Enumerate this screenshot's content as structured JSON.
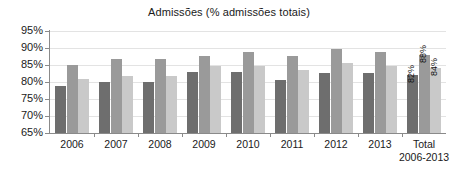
{
  "chart_data": {
    "type": "bar",
    "title": "Admissões (% admissões totais)",
    "xlabel": "",
    "ylabel": "",
    "ylim": [
      65,
      95
    ],
    "ytick_labels": [
      "95%",
      "90%",
      "85%",
      "80%",
      "75%",
      "70%",
      "65%"
    ],
    "ytick_values": [
      95,
      90,
      85,
      80,
      75,
      70,
      65
    ],
    "grid": true,
    "legend": "none",
    "categories": [
      "2006",
      "2007",
      "2008",
      "2009",
      "2010",
      "2011",
      "2012",
      "2013",
      "Total 2006-2013"
    ],
    "category_labels": [
      {
        "line1": "2006",
        "line2": ""
      },
      {
        "line1": "2007",
        "line2": ""
      },
      {
        "line1": "2008",
        "line2": ""
      },
      {
        "line1": "2009",
        "line2": ""
      },
      {
        "line1": "2010",
        "line2": ""
      },
      {
        "line1": "2011",
        "line2": ""
      },
      {
        "line1": "2012",
        "line2": ""
      },
      {
        "line1": "2013",
        "line2": ""
      },
      {
        "line1": "Total",
        "line2": "2006-2013"
      }
    ],
    "series": [
      {
        "name": "serie-1",
        "color": "#6e6e6e",
        "values": [
          78.8,
          79.9,
          79.9,
          82.9,
          82.8,
          80.7,
          82.7,
          82.7,
          82.0
        ]
      },
      {
        "name": "serie-2",
        "color": "#9a9a9a",
        "values": [
          85.0,
          86.8,
          86.8,
          87.7,
          88.8,
          87.7,
          89.8,
          88.8,
          88.0
        ]
      },
      {
        "name": "serie-3",
        "color": "#c9c9c9",
        "values": [
          81.0,
          81.8,
          81.8,
          84.8,
          84.8,
          83.6,
          85.7,
          84.7,
          84.0
        ]
      }
    ],
    "value_labels": [
      {
        "category": "Total 2006-2013",
        "series": "serie-1",
        "text": "82%"
      },
      {
        "category": "Total 2006-2013",
        "series": "serie-2",
        "text": "88%"
      },
      {
        "category": "Total 2006-2013",
        "series": "serie-3",
        "text": "84%"
      }
    ],
    "colors": {
      "series_1": "#6e6e6e",
      "series_2": "#9a9a9a",
      "series_3": "#c9c9c9",
      "axis": "#8a8a8a",
      "grid": "#e3e3e3",
      "text": "#1a1a1a",
      "background": "#ffffff"
    }
  }
}
